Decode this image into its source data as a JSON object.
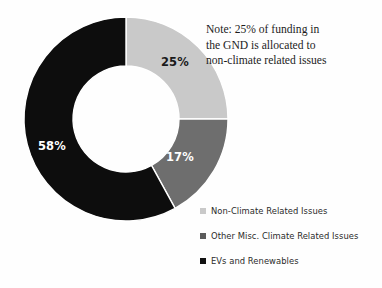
{
  "note": {
    "lines": [
      "Note: 25% of funding in",
      "the GND is allocated to",
      "non-climate related issues"
    ]
  },
  "legend": {
    "items": [
      {
        "label": "Non-Climate Related Issues",
        "color": "#c9c9c9"
      },
      {
        "label": "Other Misc. Climate Related Issues",
        "color": "#5b5b5b"
      },
      {
        "label": "EVs and Renewables",
        "color": "#111111"
      }
    ]
  },
  "chart_data": {
    "type": "pie",
    "variant": "donut",
    "title": "",
    "xlabel": "",
    "ylabel": "",
    "grid": false,
    "legend_position": "bottom-right",
    "units": "percent",
    "hole_ratio": 0.52,
    "start_angle_deg": 0,
    "direction": "clockwise",
    "categories": [
      "Non-Climate Related Issues",
      "Other Misc. Climate Related Issues",
      "EVs and Renewables"
    ],
    "values": [
      25,
      17,
      58
    ],
    "labels": [
      "25%",
      "17%",
      "58%"
    ],
    "colors": [
      "#c9c9c9",
      "#6e6e6e",
      "#0d0d0d"
    ],
    "label_colors": [
      "#1a1a1a",
      "#ffffff",
      "#ffffff"
    ],
    "annotations": [
      "Note: 25% of funding in the GND is allocated to non-climate related issues"
    ]
  },
  "geometry": {
    "center_x": 126,
    "center_y": 119,
    "outer_radius": 102,
    "inner_radius": 53,
    "label_positions": [
      {
        "x": 175,
        "y": 62
      },
      {
        "x": 180,
        "y": 157
      },
      {
        "x": 52,
        "y": 146
      }
    ]
  }
}
